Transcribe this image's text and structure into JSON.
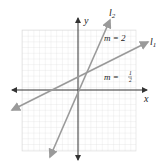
{
  "figure": {
    "axes": {
      "x_label": "x",
      "y_label": "y"
    },
    "lines": [
      {
        "name": "l1",
        "label_main": "l",
        "label_sub": "1",
        "slope_label_prefix": "m = ",
        "slope_num": "1",
        "slope_den": "2"
      },
      {
        "name": "l2",
        "label_main": "l",
        "label_sub": "2",
        "slope_label": "m = 2"
      }
    ],
    "colors": {
      "grid": "#d9d9d9",
      "axis": "#333333",
      "line": "#9a9a9a",
      "text": "#222222"
    }
  }
}
